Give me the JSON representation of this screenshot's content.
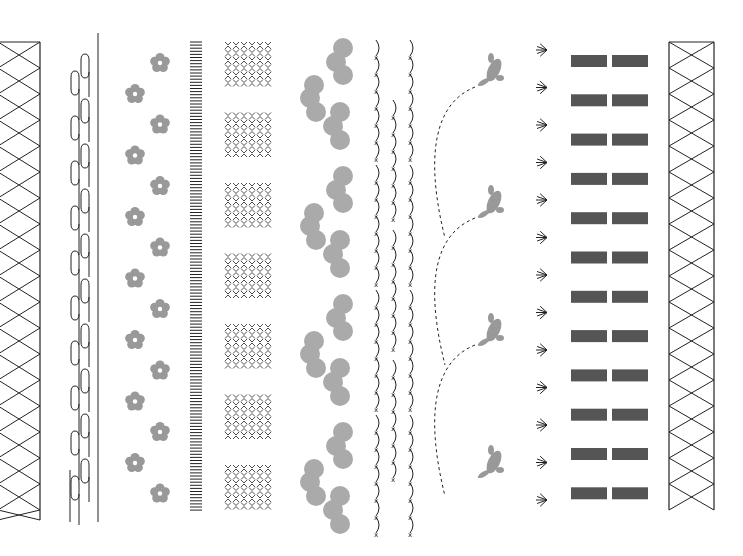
{
  "canvas": {
    "width": 743,
    "height": 556,
    "background": "#ffffff"
  },
  "colors": {
    "line": "#222222",
    "gray": "#999999",
    "dark": "#555555"
  },
  "borders": [
    {
      "name": "lattice-left",
      "x": 0,
      "width": 40,
      "top": 42,
      "bottom": 520
    },
    {
      "name": "wave-lines",
      "x": 68,
      "width": 34,
      "top": 33,
      "bottom": 522
    },
    {
      "name": "plum-flowers",
      "x": 124,
      "count": 15
    },
    {
      "name": "hatch-stripes",
      "x": 190,
      "width": 12,
      "top": 42,
      "bottom": 513
    },
    {
      "name": "kagome-blocks",
      "x": 224,
      "width": 48,
      "blocks": 7
    },
    {
      "name": "cloud-circles",
      "x": 300,
      "groups": 4
    },
    {
      "name": "stitched-arcs",
      "x": 372,
      "columns": 3
    },
    {
      "name": "hopping-rabbits",
      "x": 440,
      "count": 4
    },
    {
      "name": "sunburst-marks",
      "x": 535,
      "count": 13
    },
    {
      "name": "bar-pairs",
      "x": 570,
      "count": 12
    },
    {
      "name": "lattice-right",
      "x": 668,
      "width": 46,
      "top": 42,
      "bottom": 510
    }
  ]
}
